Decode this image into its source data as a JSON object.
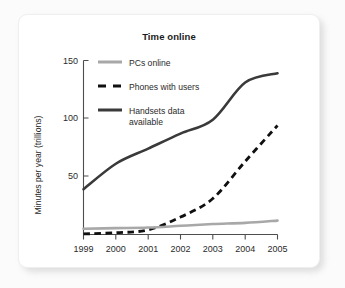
{
  "card": {
    "background_color": "#ffffff",
    "page_background_color": "#fbfbfb"
  },
  "chart_data": {
    "type": "line",
    "title": "Time online",
    "xlabel": "",
    "ylabel": "Minutes per year (trillions)",
    "x": [
      "1999",
      "2000",
      "2001",
      "2002",
      "2003",
      "2004",
      "2005"
    ],
    "xlim": [
      1999,
      2005
    ],
    "ylim": [
      0,
      150
    ],
    "yticks": [
      50,
      100,
      150
    ],
    "ytick_labels": [
      "50",
      "100",
      "150"
    ],
    "grid": false,
    "legend_position": "upper left inside",
    "series": [
      {
        "name": "PCs online",
        "style": "solid",
        "color": "#a8a8a8",
        "width": 2.6,
        "values": [
          5,
          5.5,
          6,
          7.5,
          9,
          10,
          12
        ]
      },
      {
        "name": "Phones with users",
        "style": "dashed",
        "color": "#101010",
        "width": 2.8,
        "values": [
          0.5,
          1.5,
          4,
          15,
          31,
          63,
          94
        ]
      },
      {
        "name": "Handsets data available",
        "style": "solid",
        "color": "#3a3a3a",
        "width": 2.6,
        "values": [
          39,
          61,
          74,
          87,
          99,
          131,
          139
        ]
      }
    ],
    "legend": [
      {
        "label": "PCs online",
        "swatch": "solid-gray-line"
      },
      {
        "label": "Phones with users",
        "swatch": "dashed-black-line"
      },
      {
        "label": "Handsets data",
        "label2": "available",
        "swatch": "solid-dark-line"
      }
    ],
    "axis_color": "#4d4d4d"
  }
}
